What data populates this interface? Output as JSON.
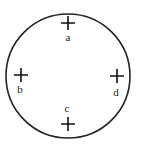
{
  "diagram": {
    "circle": {
      "cx": 68,
      "cy": 76,
      "r": 62,
      "stroke": "#222222"
    },
    "markers": [
      {
        "label": "a",
        "x": 68,
        "y": 23,
        "lx": 68,
        "ly": 41
      },
      {
        "label": "b",
        "x": 21,
        "y": 75,
        "lx": 20,
        "ly": 93
      },
      {
        "label": "c",
        "x": 68,
        "y": 124,
        "lx": 67,
        "ly": 112
      },
      {
        "label": "d",
        "x": 117,
        "y": 76,
        "lx": 116,
        "ly": 96
      }
    ]
  }
}
